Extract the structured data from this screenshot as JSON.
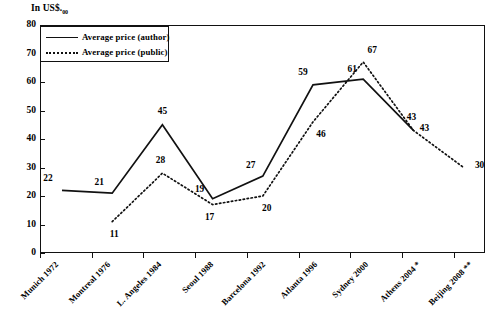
{
  "chart_data": {
    "type": "line",
    "title": "",
    "subtitle": "",
    "xlabel": "",
    "ylabel": "In US$.00",
    "ylabel_prefix": "In US$.",
    "ylabel_subscript": "00",
    "ylim": [
      0,
      80
    ],
    "ytick_step": 10,
    "yticks": [
      0,
      10,
      20,
      30,
      40,
      50,
      60,
      70,
      80
    ],
    "grid": false,
    "legend_position": "upper-left",
    "categories": [
      "Munich 1972",
      "Montreal 1976",
      "L. Angeles 1984",
      "Seoul 1988",
      "Barcelona 1992",
      "Atlanta 1996",
      "Sydney 2000",
      "Athens 2004 *",
      "Beijing 2008 **"
    ],
    "series": [
      {
        "name": "Average price (author)",
        "style": "solid",
        "values": [
          22,
          21,
          45,
          19,
          27,
          59,
          61,
          43,
          null
        ]
      },
      {
        "name": "Average price (public)",
        "style": "dotted",
        "values": [
          null,
          11,
          28,
          17,
          20,
          46,
          67,
          43,
          30
        ]
      }
    ]
  },
  "legend": {
    "items": [
      {
        "label": "Average price (author)",
        "style": "solid"
      },
      {
        "label": "Average price (public)",
        "style": "dotted"
      }
    ]
  }
}
